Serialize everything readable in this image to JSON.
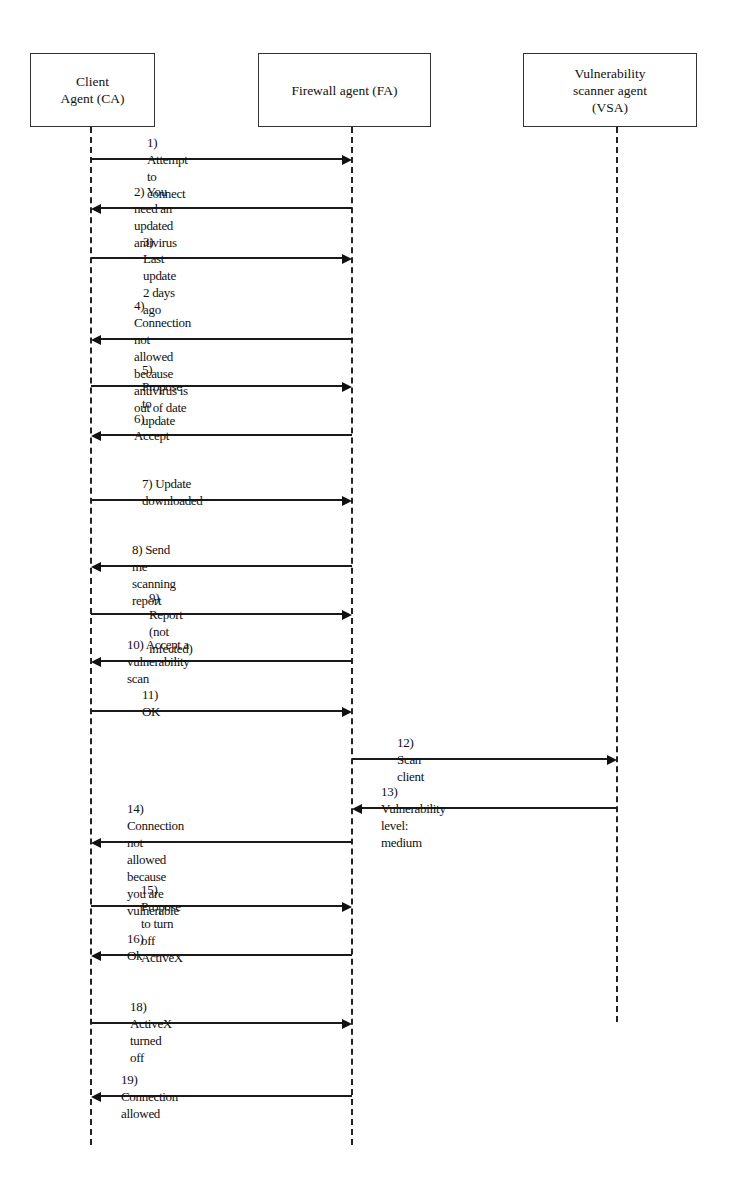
{
  "diagram": {
    "type": "sequence-diagram",
    "actors": [
      {
        "id": "CA",
        "label": "Client\nAgent (CA)",
        "box": {
          "x": 30,
          "y": 53,
          "w": 125,
          "h": 74
        },
        "lifeline_x": 91,
        "lifeline_end": 1145
      },
      {
        "id": "FA",
        "label": "Firewall agent (FA)",
        "box": {
          "x": 258,
          "y": 53,
          "w": 173,
          "h": 74
        },
        "lifeline_x": 352,
        "lifeline_end": 1145
      },
      {
        "id": "VSA",
        "label": "Vulnerability\nscanner agent\n(VSA)",
        "box": {
          "x": 523,
          "y": 53,
          "w": 174,
          "h": 74
        },
        "lifeline_x": 617,
        "lifeline_end": 1022
      }
    ],
    "messages": [
      {
        "n": "1",
        "label": "1) Attempt to connect",
        "from": "CA",
        "to": "FA",
        "y": 159,
        "label_x": 147,
        "lines": 1
      },
      {
        "n": "2",
        "label": "2) You need an updated antivirus",
        "from": "FA",
        "to": "CA",
        "y": 208,
        "label_x": 134,
        "lines": 1
      },
      {
        "n": "3",
        "label": "3) Last update 2 days ago",
        "from": "CA",
        "to": "FA",
        "y": 258,
        "label_x": 143,
        "lines": 1
      },
      {
        "n": "4",
        "label": "4) Connection not allowed\nbecause antivirus is out of date",
        "from": "FA",
        "to": "CA",
        "y": 339,
        "label_x": 134,
        "lines": 2
      },
      {
        "n": "5",
        "label": "5) Propose to update",
        "from": "CA",
        "to": "FA",
        "y": 386,
        "label_x": 142,
        "lines": 1
      },
      {
        "n": "6",
        "label": "6) Accept",
        "from": "FA",
        "to": "CA",
        "y": 435,
        "label_x": 134,
        "lines": 1
      },
      {
        "n": "7",
        "label": "7) Update downloaded",
        "from": "CA",
        "to": "FA",
        "y": 500,
        "label_x": 142,
        "lines": 1
      },
      {
        "n": "8",
        "label": "8) Send me scanning report",
        "from": "FA",
        "to": "CA",
        "y": 566,
        "label_x": 132,
        "lines": 1
      },
      {
        "n": "9",
        "label": "9) Report (not infected)",
        "from": "CA",
        "to": "FA",
        "y": 614,
        "label_x": 149,
        "lines": 1
      },
      {
        "n": "10",
        "label": "10) Accept a vulnerability scan",
        "from": "FA",
        "to": "CA",
        "y": 661,
        "label_x": 127,
        "lines": 1
      },
      {
        "n": "11",
        "label": "11) OK",
        "from": "CA",
        "to": "FA",
        "y": 711,
        "label_x": 142,
        "lines": 1
      },
      {
        "n": "12",
        "label": "12) Scan client",
        "from": "FA",
        "to": "VSA",
        "y": 759,
        "label_x": 397,
        "lines": 1
      },
      {
        "n": "13",
        "label": "13) Vulnerability level: medium",
        "from": "VSA",
        "to": "FA",
        "y": 808,
        "label_x": 381,
        "lines": 1
      },
      {
        "n": "14",
        "label": "14) Connection not allowed\nbecause you are vulnerable",
        "from": "FA",
        "to": "CA",
        "y": 842,
        "label_x": 127,
        "lines": 2
      },
      {
        "n": "15",
        "label": "15) Propose to turn off ActiveX",
        "from": "CA",
        "to": "FA",
        "y": 906,
        "label_x": 141,
        "lines": 1
      },
      {
        "n": "16",
        "label": "16) Ok",
        "from": "FA",
        "to": "CA",
        "y": 955,
        "label_x": 127,
        "lines": 1
      },
      {
        "n": "18",
        "label": "18) ActiveX turned off",
        "from": "CA",
        "to": "FA",
        "y": 1023,
        "label_x": 130,
        "lines": 1
      },
      {
        "n": "19",
        "label": "19) Connection allowed",
        "from": "FA",
        "to": "CA",
        "y": 1096,
        "label_x": 121,
        "lines": 1
      }
    ],
    "colors": {
      "line": "#1a1a1a",
      "box_border": "#333333",
      "background": "#ffffff"
    }
  }
}
